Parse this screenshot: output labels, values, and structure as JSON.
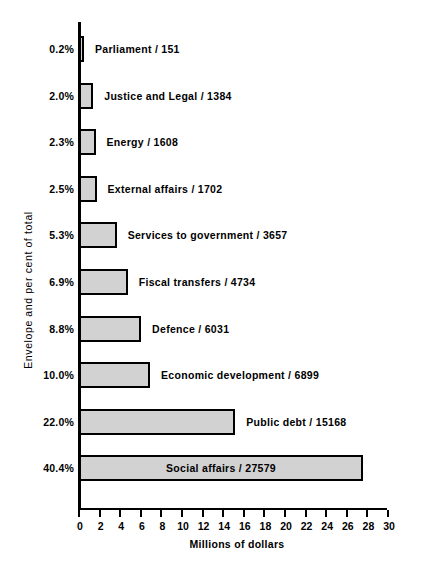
{
  "chart_data": {
    "type": "bar",
    "orientation": "horizontal",
    "title": "",
    "xlabel": "Millions of dollars",
    "ylabel": "Envelope and per cent of total",
    "xlim": [
      0,
      30
    ],
    "xticks": [
      0,
      2,
      4,
      6,
      8,
      10,
      12,
      14,
      16,
      18,
      20,
      22,
      24,
      26,
      28,
      30
    ],
    "xtick_labels": [
      "0",
      "2",
      "4",
      "6",
      "8",
      "10",
      "12",
      "14",
      "16",
      "18",
      "20",
      "22",
      "24",
      "26",
      "28",
      "30"
    ],
    "grid": false,
    "legend": null,
    "bar_fill_color": "#d2d2d2",
    "bar_edge_color": "#000000",
    "categories": [
      "Parliament",
      "Justice and Legal",
      "Energy",
      "External affairs",
      "Services to government",
      "Fiscal transfers",
      "Defence",
      "Economic development",
      "Public debt",
      "Social affairs"
    ],
    "values": [
      0.151,
      1.384,
      1.608,
      1.702,
      3.657,
      4.734,
      6.031,
      6.899,
      15.168,
      27.579
    ],
    "bars": [
      {
        "category": "Parliament",
        "amount": "151",
        "value": 0.151,
        "percent": "0.2%",
        "label": "Parliament / 151",
        "label_position": "outside"
      },
      {
        "category": "Justice and Legal",
        "amount": "1384",
        "value": 1.384,
        "percent": "2.0%",
        "label": "Justice and Legal / 1384",
        "label_position": "outside"
      },
      {
        "category": "Energy",
        "amount": "1608",
        "value": 1.608,
        "percent": "2.3%",
        "label": "Energy / 1608",
        "label_position": "outside"
      },
      {
        "category": "External affairs",
        "amount": "1702",
        "value": 1.702,
        "percent": "2.5%",
        "label": "External affairs / 1702",
        "label_position": "outside"
      },
      {
        "category": "Services to government",
        "amount": "3657",
        "value": 3.657,
        "percent": "5.3%",
        "label": "Services to government / 3657",
        "label_position": "outside"
      },
      {
        "category": "Fiscal transfers",
        "amount": "4734",
        "value": 4.734,
        "percent": "6.9%",
        "label": "Fiscal transfers / 4734",
        "label_position": "outside"
      },
      {
        "category": "Defence",
        "amount": "6031",
        "value": 6.031,
        "percent": "8.8%",
        "label": "Defence / 6031",
        "label_position": "outside"
      },
      {
        "category": "Economic development",
        "amount": "6899",
        "value": 6.899,
        "percent": "10.0%",
        "label": "Economic development / 6899",
        "label_position": "outside"
      },
      {
        "category": "Public debt",
        "amount": "15168",
        "value": 15.168,
        "percent": "22.0%",
        "label": "Public debt / 15168",
        "label_position": "outside"
      },
      {
        "category": "Social affairs",
        "amount": "27579",
        "value": 27.579,
        "percent": "40.4%",
        "label": "Social affairs / 27579",
        "label_position": "inside"
      }
    ]
  }
}
